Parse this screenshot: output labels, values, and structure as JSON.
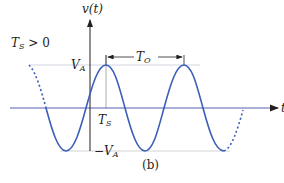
{
  "figure": {
    "caption": "(b)",
    "y_axis_label": "v(t)",
    "x_axis_label": "t",
    "condition_label_main": "T",
    "condition_label_sub": "S",
    "condition_label_rest": " > 0",
    "amplitude_pos_main": "V",
    "amplitude_pos_sub": "A",
    "amplitude_neg_main": "−V",
    "amplitude_neg_sub": "A",
    "shift_label_main": "T",
    "shift_label_sub": "S",
    "period_label_main": "T",
    "period_label_sub": "O"
  },
  "colors": {
    "waveform": "#3a5fb8",
    "axis": "#231f20",
    "guide": "#b0b0b0",
    "t_axis": "#5560b0"
  }
}
